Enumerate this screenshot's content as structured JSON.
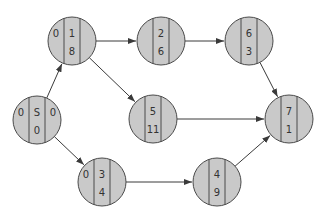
{
  "diagram": {
    "type": "network-graph",
    "colors": {
      "node_fill": "#c9c9c9",
      "node_stroke": "#4a4a4a",
      "edge": "#3a3a3a",
      "text": "#333333"
    },
    "nodes": [
      {
        "id": "S",
        "cx": 37,
        "cy": 120,
        "left": "0",
        "top": "S",
        "bottom": "0",
        "right": "0"
      },
      {
        "id": "1",
        "cx": 72,
        "cy": 41,
        "left": "0",
        "top": "1",
        "bottom": "8",
        "right": ""
      },
      {
        "id": "2",
        "cx": 161,
        "cy": 41,
        "left": "",
        "top": "2",
        "bottom": "6",
        "right": ""
      },
      {
        "id": "6",
        "cx": 249,
        "cy": 41,
        "left": "",
        "top": "6",
        "bottom": "3",
        "right": ""
      },
      {
        "id": "5",
        "cx": 153,
        "cy": 119,
        "left": "",
        "top": "5",
        "bottom": "11",
        "right": ""
      },
      {
        "id": "7",
        "cx": 289,
        "cy": 119,
        "left": "",
        "top": "7",
        "bottom": "1",
        "right": ""
      },
      {
        "id": "3",
        "cx": 102,
        "cy": 182,
        "left": "0",
        "top": "3",
        "bottom": "4",
        "right": ""
      },
      {
        "id": "4",
        "cx": 217,
        "cy": 182,
        "left": "",
        "top": "4",
        "bottom": "9",
        "right": ""
      }
    ],
    "edges": [
      {
        "from": "S",
        "to": "1"
      },
      {
        "from": "S",
        "to": "3"
      },
      {
        "from": "1",
        "to": "2"
      },
      {
        "from": "1",
        "to": "5"
      },
      {
        "from": "2",
        "to": "6"
      },
      {
        "from": "6",
        "to": "7"
      },
      {
        "from": "5",
        "to": "7"
      },
      {
        "from": "3",
        "to": "4"
      },
      {
        "from": "4",
        "to": "7"
      }
    ]
  }
}
